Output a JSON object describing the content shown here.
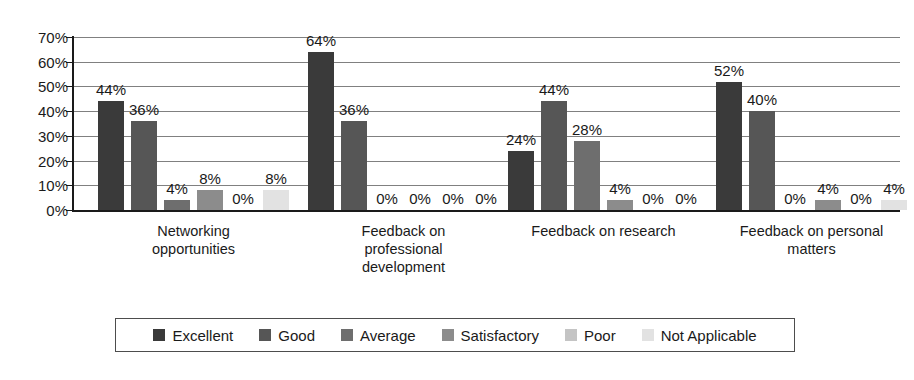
{
  "chart_data": {
    "type": "bar",
    "title": "",
    "xlabel": "",
    "ylabel": "",
    "ylim": [
      0,
      70
    ],
    "ytick_labels": [
      "0%",
      "10%",
      "20%",
      "30%",
      "40%",
      "50%",
      "60%",
      "70%"
    ],
    "ytick_values": [
      0,
      10,
      20,
      30,
      40,
      50,
      60,
      70
    ],
    "grid": true,
    "legend_position": "bottom",
    "value_label_suffix": "%",
    "categories": [
      "Networking opportunities",
      "Feedback on professional development",
      "Feedback on research",
      "Feedback on personal matters"
    ],
    "category_lines": [
      [
        "Networking",
        "opportunities"
      ],
      [
        "Feedback on",
        "professional",
        "development"
      ],
      [
        "Feedback on research"
      ],
      [
        "Feedback on personal",
        "matters"
      ]
    ],
    "series": [
      {
        "name": "Excellent",
        "color": "#3a3a3a",
        "values": [
          44,
          64,
          24,
          52
        ]
      },
      {
        "name": "Good",
        "color": "#565656",
        "values": [
          36,
          36,
          44,
          40
        ]
      },
      {
        "name": "Average",
        "color": "#6e6e6e",
        "values": [
          4,
          0,
          28,
          0
        ]
      },
      {
        "name": "Satisfactory",
        "color": "#8c8c8c",
        "values": [
          8,
          0,
          4,
          4
        ]
      },
      {
        "name": "Poor",
        "color": "#c4c4c4",
        "values": [
          0,
          0,
          0,
          0
        ]
      },
      {
        "name": "Not Applicable",
        "color": "#e2e2e2",
        "values": [
          8,
          0,
          0,
          4
        ]
      }
    ],
    "value_labels": [
      [
        "44%",
        "36%",
        "4%",
        "8%",
        "0%",
        "8%"
      ],
      [
        "64%",
        "36%",
        "0%",
        "0%",
        "0%",
        "0%"
      ],
      [
        "24%",
        "44%",
        "28%",
        "4%",
        "0%",
        "0%"
      ],
      [
        "52%",
        "40%",
        "0%",
        "4%",
        "0%",
        "4%"
      ]
    ]
  },
  "legend": {
    "items": [
      {
        "label": "Excellent",
        "color": "#3a3a3a"
      },
      {
        "label": "Good",
        "color": "#565656"
      },
      {
        "label": "Average",
        "color": "#6e6e6e"
      },
      {
        "label": "Satisfactory",
        "color": "#8c8c8c"
      },
      {
        "label": "Poor",
        "color": "#c4c4c4"
      },
      {
        "label": "Not Applicable",
        "color": "#e2e2e2"
      }
    ]
  }
}
